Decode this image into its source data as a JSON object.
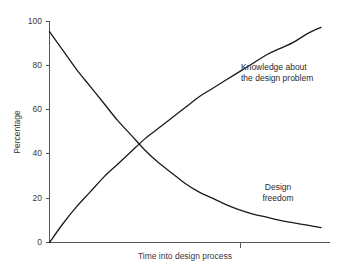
{
  "chart_data": {
    "type": "line",
    "title": "",
    "xlabel": "Time into design process",
    "ylabel": "Percentage",
    "ylim": [
      0,
      105
    ],
    "xlim": [
      0,
      100
    ],
    "ytick_labels": [
      "0",
      "20",
      "40",
      "60",
      "80",
      "100"
    ],
    "ytick_values": [
      0,
      20,
      40,
      60,
      80,
      100
    ],
    "xtick_labels": [
      ""
    ],
    "grid": false,
    "legend_position": "inline-annotations",
    "annotations": [
      {
        "name": "knowledge",
        "lines": [
          "Knowledge about",
          "the design problem"
        ],
        "text": "Knowledge about the design problem"
      },
      {
        "name": "freedom",
        "lines": [
          "Design",
          "freedom"
        ],
        "text": "Design freedom"
      }
    ],
    "series": [
      {
        "name": "Knowledge about the design problem",
        "color": "#1a1a1a",
        "x": [
          0,
          5,
          10,
          15,
          20,
          25,
          30,
          35,
          40,
          45,
          50,
          55,
          60,
          65,
          70,
          75,
          80,
          85,
          90,
          95,
          100
        ],
        "values": [
          0,
          9,
          17,
          24,
          31,
          37,
          43,
          49,
          54,
          59,
          64,
          69,
          73,
          77,
          81,
          85,
          89,
          92,
          95,
          99,
          102
        ]
      },
      {
        "name": "Design freedom",
        "color": "#1a1a1a",
        "x": [
          0,
          5,
          10,
          15,
          20,
          25,
          30,
          35,
          40,
          45,
          50,
          55,
          60,
          65,
          70,
          75,
          80,
          85,
          90,
          95,
          100
        ],
        "values": [
          100,
          91,
          82,
          74,
          66,
          58,
          51,
          44,
          38,
          33,
          28,
          24,
          21,
          18,
          15.5,
          13.5,
          12,
          10.5,
          9.3,
          8.2,
          7
        ]
      }
    ],
    "crossing_point": {
      "x": 32,
      "y": 45
    }
  }
}
